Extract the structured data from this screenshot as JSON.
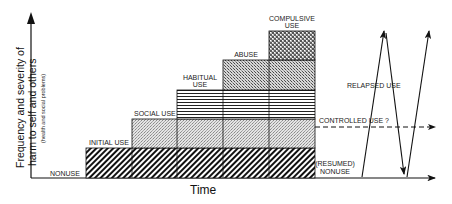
{
  "diagram": {
    "y_axis": {
      "label_line1": "Frequency and severity of",
      "label_line2": "harm to self and others",
      "sublabel": "(health and social problems)"
    },
    "x_axis": {
      "label": "Time"
    },
    "stages": [
      {
        "name": "NONUSE",
        "pattern": "none"
      },
      {
        "name": "INITIAL USE",
        "pattern": "diagonal-hatch"
      },
      {
        "name": "SOCIAL USE",
        "pattern": "fine-stipple"
      },
      {
        "name": "HABITUAL",
        "name_line2": "USE",
        "pattern": "horizontal-lines"
      },
      {
        "name": "ABUSE",
        "pattern": "crosshatch"
      },
      {
        "name": "COMPULSIVE",
        "name_line2": "USE",
        "pattern": "dense-dots"
      }
    ],
    "outcomes": {
      "relapsed": "RELAPSED USE",
      "controlled": "CONTROLLED USE ?",
      "resumed_line1": "(RESUMED)",
      "resumed_line2": "NONUSE"
    },
    "colors": {
      "ink": "#111111",
      "background": "#ffffff"
    }
  }
}
